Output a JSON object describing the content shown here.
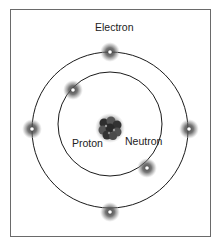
{
  "diagram": {
    "labels": {
      "electron": "Electron",
      "proton": "Proton",
      "neutron": "Neutron"
    },
    "orbits": [
      {
        "name": "inner-orbit",
        "cx": 110,
        "cy": 124,
        "r": 52
      },
      {
        "name": "outer-orbit",
        "cx": 110,
        "cy": 130,
        "r": 78
      }
    ],
    "electrons": [
      {
        "orbit": "outer",
        "x": 110,
        "y": 52
      },
      {
        "orbit": "outer",
        "x": 32,
        "y": 129
      },
      {
        "orbit": "outer",
        "x": 189,
        "y": 129
      },
      {
        "orbit": "outer",
        "x": 110,
        "y": 212
      },
      {
        "orbit": "inner",
        "x": 73,
        "y": 90
      },
      {
        "orbit": "inner",
        "x": 147,
        "y": 168
      }
    ],
    "nucleus": {
      "x": 110,
      "y": 128
    },
    "colors": {
      "orbit": "#1a1a1a",
      "electron_glow": "#555555",
      "electron_core": "#ffffff",
      "nucleus": "#3a3a3a",
      "frame": "#6a6a6a"
    }
  }
}
